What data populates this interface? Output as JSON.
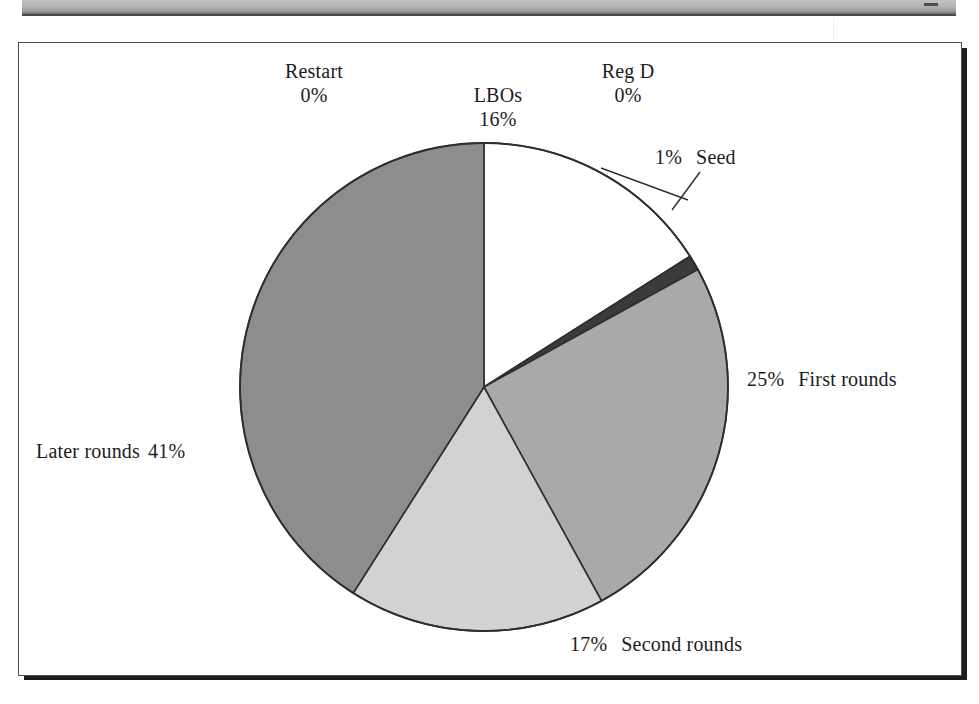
{
  "page": {
    "background_color": "#ffffff",
    "header_bar_color": "#b4b4b4",
    "frame_border_color": "#4f4f4f",
    "shadow_color": "#1c1c1c"
  },
  "chart_data": {
    "type": "pie",
    "title": "",
    "subtitle": "",
    "xlabel": "",
    "ylabel": "",
    "legend_position": "none",
    "grid": false,
    "units": "percent",
    "start_angle_deg": 0,
    "direction": "clockwise",
    "categories": [
      "LBOs",
      "Reg D",
      "Seed",
      "First rounds",
      "Second rounds",
      "Later rounds",
      "Restart"
    ],
    "values": [
      16,
      0,
      1,
      25,
      17,
      41,
      0
    ],
    "labels": [
      "16%",
      "0%",
      "1%",
      "25%",
      "17%",
      "41%",
      "0%"
    ],
    "colors": [
      "#ffffff",
      "#ffffff",
      "#3b3b3b",
      "#a9a9a9",
      "#d2d2d2",
      "#8d8d8d",
      "#ffffff"
    ],
    "slices": [
      {
        "name": "LBOs",
        "value": 16,
        "label": "LBOs",
        "pct_text": "16%",
        "color": "#ffffff",
        "callout": false
      },
      {
        "name": "Reg D",
        "value": 0,
        "label": "Reg D",
        "pct_text": "0%",
        "color": "#ffffff",
        "callout": true
      },
      {
        "name": "Seed",
        "value": 1,
        "label": "Seed",
        "pct_text": "1%",
        "color": "#3b3b3b",
        "callout": true
      },
      {
        "name": "First rounds",
        "value": 25,
        "label": "First rounds",
        "pct_text": "25%",
        "color": "#a9a9a9",
        "callout": false
      },
      {
        "name": "Second rounds",
        "value": 17,
        "label": "Second rounds",
        "pct_text": "17%",
        "color": "#d2d2d2",
        "callout": false
      },
      {
        "name": "Later rounds",
        "value": 41,
        "label": "Later rounds",
        "pct_text": "41%",
        "color": "#8d8d8d",
        "callout": false
      },
      {
        "name": "Restart",
        "value": 0,
        "label": "Restart",
        "pct_text": "0%",
        "color": "#ffffff",
        "callout": true
      }
    ]
  },
  "labels": {
    "restart": {
      "name": "Restart",
      "pct": "0%"
    },
    "lbos": {
      "name": "LBOs",
      "pct": "16%"
    },
    "regd": {
      "name": "Reg D",
      "pct": "0%"
    },
    "seed": {
      "name": "Seed",
      "pct": "1%"
    },
    "first_rounds": {
      "name": "First rounds",
      "pct": "25%"
    },
    "second_rounds": {
      "name": "Second rounds",
      "pct": "17%"
    },
    "later_rounds": {
      "name": "Later rounds",
      "pct": "41%"
    }
  }
}
